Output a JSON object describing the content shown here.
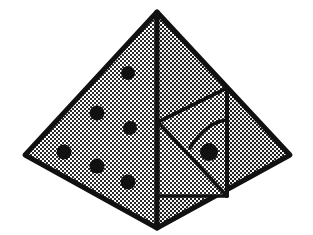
{
  "figure": {
    "title": "Pyramid with dotted faces, inner panel, arc and pupil",
    "type": "line-drawing",
    "canvas": {
      "width": 313,
      "height": 235,
      "background": "#ffffff"
    },
    "colors": {
      "stroke": "#111111",
      "fill_light": "#d8d8d8",
      "fill_mid": "#c4c4c4",
      "dot": "#111111",
      "background": "#ffffff"
    },
    "stroke_widths": {
      "outline": 5,
      "ridge": 4,
      "inner": 3.5,
      "arc": 3
    },
    "vertices": {
      "apex": {
        "x": 157,
        "y": 12
      },
      "left": {
        "x": 25,
        "y": 155
      },
      "right": {
        "x": 290,
        "y": 155
      },
      "bottom": {
        "x": 157,
        "y": 228
      }
    },
    "faces": [
      {
        "name": "left-face",
        "label": "Left face",
        "points": "157,12 25,155 157,228",
        "fill": "#d8d8d8"
      },
      {
        "name": "right-face",
        "label": "Right face",
        "points": "157,12 290,155 157,228",
        "fill": "#c4c4c4"
      }
    ],
    "ridge": {
      "name": "center-ridge",
      "label": "Center vertical ridge",
      "x1": 157,
      "y1": 12,
      "x2": 157,
      "y2": 228
    },
    "right_edge_line": {
      "name": "right-vertical-line",
      "label": "Vertical division on right face",
      "x1": 227,
      "y1": 88,
      "x2": 227,
      "y2": 196
    },
    "inner_panel": {
      "name": "inner-quad",
      "label": "Inner quadrilateral panel",
      "points": "158,122 227,88 227,196 158,196",
      "fill": "#d8d8d8"
    },
    "inner_diagonal": {
      "name": "inner-diagonal",
      "label": "Diagonal of inner panel",
      "x1": 158,
      "y1": 122,
      "x2": 227,
      "y2": 196
    },
    "arc": {
      "name": "quarter-arc",
      "label": "Curved arc inside inner panel",
      "path": "M 227,120 Q 206,122 190,148",
      "fill": "none"
    },
    "left_face_dots": [
      {
        "name": "dot-1",
        "cx": 128,
        "cy": 73,
        "r": 7
      },
      {
        "name": "dot-2",
        "cx": 97,
        "cy": 113,
        "r": 7.5
      },
      {
        "name": "dot-3",
        "cx": 130,
        "cy": 128,
        "r": 7
      },
      {
        "name": "dot-4",
        "cx": 64,
        "cy": 152,
        "r": 7.5
      },
      {
        "name": "dot-5",
        "cx": 97,
        "cy": 166,
        "r": 7.5
      },
      {
        "name": "dot-6",
        "cx": 128,
        "cy": 182,
        "r": 7.5
      }
    ],
    "pupil_dot": {
      "name": "pupil-dot",
      "label": "Dot inside arc",
      "cx": 209,
      "cy": 152,
      "r": 9
    },
    "dot_count": 6,
    "texture": {
      "name": "checker-dither",
      "label": "50% checkerboard dither shading",
      "cell": 2
    }
  }
}
